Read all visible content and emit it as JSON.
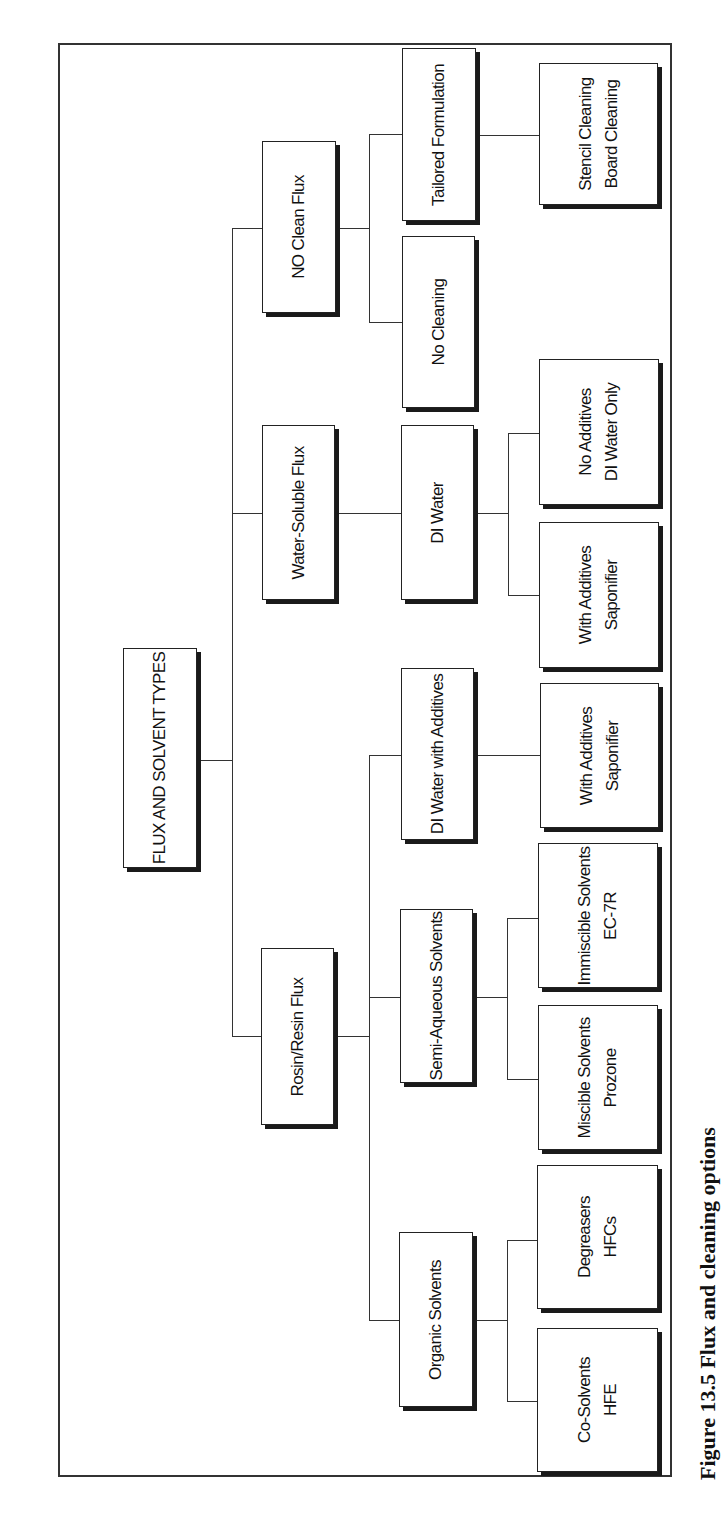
{
  "diagram": {
    "root": {
      "label": "FLUX AND SOLVENT TYPES"
    },
    "level1": [
      {
        "id": "no_clean",
        "label": "NO Clean Flux"
      },
      {
        "id": "water_soluble",
        "label": "Water-Soluble Flux"
      },
      {
        "id": "rosin",
        "label": "Rosin/Resin Flux"
      }
    ],
    "no_clean_children": [
      {
        "label": "Tailored Formulation"
      },
      {
        "label": "No Cleaning"
      }
    ],
    "tailored_children": [
      {
        "line1": "Stencil Cleaning",
        "line2": "Board Cleaning"
      }
    ],
    "water_soluble_children": [
      {
        "label": "DI Water"
      }
    ],
    "di_water_children": [
      {
        "line1": "No Additives",
        "line2": "DI Water Only"
      },
      {
        "line1": "With Additives",
        "line2": "Saponifier"
      }
    ],
    "rosin_children": [
      {
        "label": "DI Water with Additives"
      },
      {
        "label": "Semi-Aqueous Solvents"
      },
      {
        "label": "Organic Solvents"
      }
    ],
    "di_water_additives_children": [
      {
        "line1": "With Additives",
        "line2": "Saponifier"
      }
    ],
    "semi_aqueous_children": [
      {
        "line1": "Immiscible Solvents",
        "line2": "EC-7R"
      },
      {
        "line1": "Miscible Solvents",
        "line2": "Prozone"
      }
    ],
    "organic_children": [
      {
        "line1": "Degreasers",
        "line2": "HFCs"
      },
      {
        "line1": "Co-Solvents",
        "line2": "HFE"
      }
    ]
  },
  "caption": "Figure 13.5 Flux and cleaning options",
  "colors": {
    "line": "#333333",
    "box_border": "#222222",
    "shadow": "#1a1a1a",
    "background": "#ffffff"
  }
}
